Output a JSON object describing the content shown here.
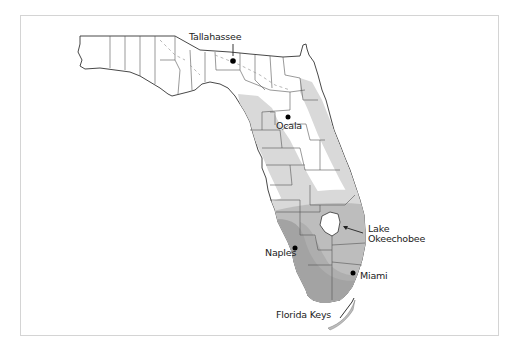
{
  "map": {
    "region": "Florida",
    "colors": {
      "background": "#ffffff",
      "frame_border": "#d4d4d4",
      "land": "#ffffff",
      "county_lines": "#555555",
      "zone_light": "#d9d9d9",
      "zone_medium": "#bdbdbd",
      "zone_dark": "#a3a3a3",
      "lake": "#ffffff"
    },
    "labels": {
      "tallahassee": "Tallahassee",
      "ocala": "Ocala",
      "lake_line1": "Lake",
      "lake_line2": "Okeechobee",
      "naples": "Naples",
      "miami": "Miami",
      "florida_keys": "Florida Keys"
    },
    "points": [
      {
        "name": "Tallahassee",
        "x": 231,
        "y": 60
      },
      {
        "name": "Ocala",
        "x": 288,
        "y": 117
      },
      {
        "name": "Naples",
        "x": 295,
        "y": 248
      },
      {
        "name": "Miami",
        "x": 353,
        "y": 273
      }
    ]
  }
}
